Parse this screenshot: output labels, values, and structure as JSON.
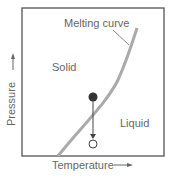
{
  "diagram": {
    "curve_label": "Melting curve",
    "regions": {
      "solid": "Solid",
      "liquid": "Liquid"
    },
    "axes": {
      "x_label": "Temperature",
      "y_label": "Pressure",
      "x_arrow": "—▸",
      "y_arrow": "—▸"
    },
    "points": [
      {
        "name": "initial-state",
        "style": "filled"
      },
      {
        "name": "final-state",
        "style": "open"
      }
    ],
    "colors": {
      "frame": "#555555",
      "curve": "#aaaaaa",
      "text": "#666666",
      "dot": "#333333"
    }
  }
}
